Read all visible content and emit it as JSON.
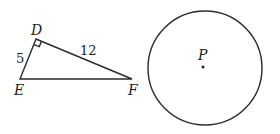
{
  "triangle": {
    "vertices": {
      "D": {
        "label": "D",
        "x": 36,
        "y": 39
      },
      "E": {
        "label": "E",
        "x": 20,
        "y": 79
      },
      "F": {
        "label": "F",
        "x": 132,
        "y": 79
      }
    },
    "right_angle_at": "D",
    "sides": {
      "DE": {
        "label": "5"
      },
      "DF": {
        "label": "12"
      }
    }
  },
  "circle": {
    "center": {
      "label": "P",
      "x": 205,
      "y": 68
    },
    "radius": 57
  },
  "colors": {
    "stroke": "#2a2a2a",
    "text": "#222222",
    "background": "#ffffff"
  }
}
